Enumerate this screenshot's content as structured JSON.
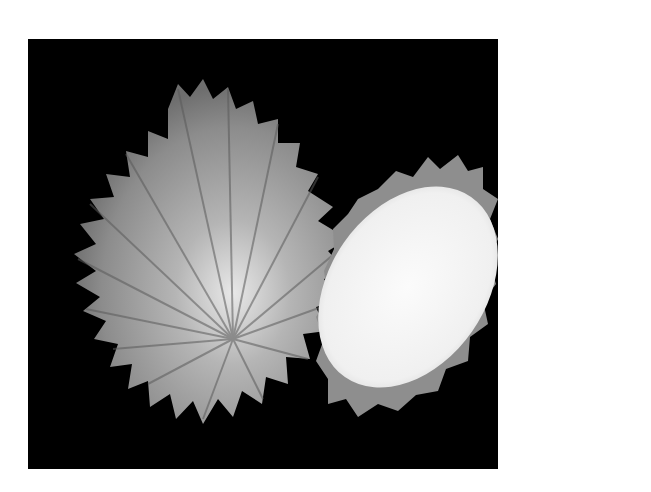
{
  "image": {
    "description": "Black-and-white photograph of two shell valves (spiny oyster) on a black background",
    "background_color": "#000000",
    "page_color": "#ffffff",
    "subjects": [
      {
        "name": "ribbed-shell-valve-exterior",
        "tone": "#9a9a9a"
      },
      {
        "name": "shell-valve-interior",
        "tone": "#f4f4f4",
        "rim_tone": "#8a8a8a"
      }
    ]
  }
}
